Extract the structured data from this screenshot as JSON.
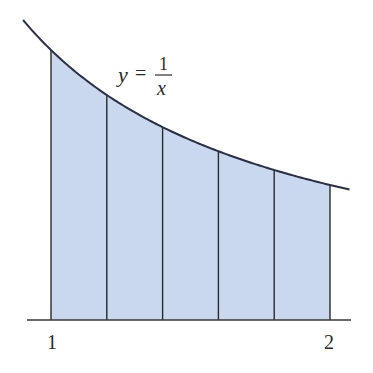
{
  "diagram": {
    "function_label": {
      "lhs": "y",
      "eq": "=",
      "numerator": "1",
      "denominator": "x"
    },
    "x_start_label": "1",
    "x_end_label": "2",
    "interval": [
      1,
      2
    ],
    "num_strips": 5,
    "strip_boundaries": [
      1.0,
      1.2,
      1.4,
      1.6,
      1.8,
      2.0
    ],
    "curve_domain": [
      0.9,
      2.07
    ],
    "colors": {
      "fill": "#c9d8ee",
      "curve": "#2b2f45",
      "lines": "#2a2a2a",
      "axis": "#3a3a3a"
    }
  }
}
